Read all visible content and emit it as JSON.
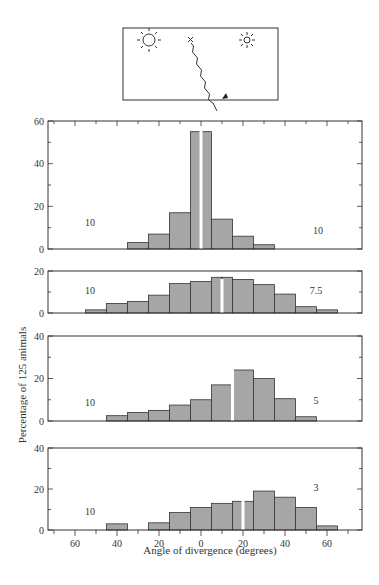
{
  "figure": {
    "inset": {
      "description": "Schematic: two suns (sun left, smaller sun right), X start mark, wavy path going down-right with arrow",
      "icons": [
        "sun-icon",
        "small-sun-icon",
        "x-mark-icon",
        "wavy-path-arrow-icon"
      ]
    },
    "ylabel": "Percentage of 125 animals",
    "xlabel": "Angle of divergence (degrees)",
    "x_tick_labels": [
      "60",
      "40",
      "20",
      "0",
      "20",
      "40",
      "60"
    ],
    "bar_color": "#a6a6a6",
    "edge_color": "#333333"
  },
  "chart_data": [
    {
      "type": "bar",
      "title": "",
      "ylim": [
        0,
        60
      ],
      "yticks": [
        "0",
        "20",
        "40",
        "60"
      ],
      "marker_deg": 0,
      "annotation_left": "10",
      "annotation_right": "10",
      "bins_deg": [
        -35,
        -25,
        -15,
        -5,
        0,
        5,
        15,
        25,
        35
      ],
      "values": [
        3,
        7,
        17,
        55,
        55,
        14,
        6,
        2
      ],
      "xlabel": "",
      "ylabel": ""
    },
    {
      "type": "bar",
      "title": "",
      "ylim": [
        0,
        20
      ],
      "yticks": [
        "0",
        "20"
      ],
      "marker_deg": 10,
      "annotation_left": "10",
      "annotation_right": "7.5",
      "bins_deg": [
        -55,
        -45,
        -35,
        -25,
        -15,
        -5,
        5,
        10,
        15,
        25,
        35,
        45,
        55,
        65
      ],
      "values": [
        1.5,
        4.5,
        5.5,
        8.5,
        14,
        15,
        17,
        17,
        16,
        13.5,
        9,
        3,
        1.5
      ],
      "xlabel": "",
      "ylabel": ""
    },
    {
      "type": "bar",
      "title": "",
      "ylim": [
        0,
        40
      ],
      "yticks": [
        "0",
        "20",
        "40"
      ],
      "marker_deg": 15,
      "annotation_left": "10",
      "annotation_right": "5",
      "bins_deg": [
        -45,
        -35,
        -25,
        -15,
        -5,
        5,
        15,
        25,
        35,
        45,
        55
      ],
      "values": [
        2.5,
        4,
        5,
        7.5,
        10,
        17,
        24,
        20,
        10.5,
        2
      ],
      "xlabel": "",
      "ylabel": ""
    },
    {
      "type": "bar",
      "title": "",
      "ylim": [
        0,
        40
      ],
      "yticks": [
        "0",
        "20",
        "40"
      ],
      "marker_deg": 20,
      "annotation_left": "10",
      "annotation_right": "3",
      "bins_deg": [
        -45,
        -35,
        -25,
        -15,
        -5,
        5,
        15,
        20,
        25,
        35,
        45,
        55,
        65
      ],
      "values_note": "gap between -35 and -25 has 0",
      "segments": [
        {
          "from": -45,
          "to": -35,
          "value": 3
        },
        {
          "from": -25,
          "to": -15,
          "value": 3.5
        },
        {
          "from": -15,
          "to": -5,
          "value": 8.5
        },
        {
          "from": -5,
          "to": 5,
          "value": 11
        },
        {
          "from": 5,
          "to": 15,
          "value": 13
        },
        {
          "from": 15,
          "to": 20,
          "value": 14
        },
        {
          "from": 20,
          "to": 25,
          "value": 14
        },
        {
          "from": 25,
          "to": 35,
          "value": 19
        },
        {
          "from": 35,
          "to": 45,
          "value": 16
        },
        {
          "from": 45,
          "to": 55,
          "value": 11
        },
        {
          "from": 55,
          "to": 65,
          "value": 2
        }
      ],
      "xlabel": "Angle of divergence (degrees)",
      "ylabel": ""
    }
  ]
}
